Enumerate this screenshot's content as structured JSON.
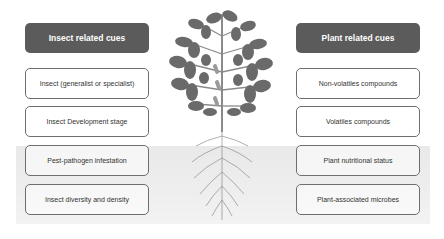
{
  "left_panel": {
    "header": "Insect related cues",
    "items": [
      "Insect (generalist or specialist)",
      "Insect Development stage",
      "Pest-pathogen infestation",
      "Insect diversity and density"
    ]
  },
  "right_panel": {
    "header": "Plant related cues",
    "items": [
      "Non-volatiles compounds",
      "Volatiles compounds",
      "Plant nutritional status",
      "Plant-associated microbes"
    ]
  },
  "illustration": {
    "icon": "plant-with-roots-icon",
    "colors": {
      "header_bg": "#5b5b5b",
      "leaf": "#6a6a6a",
      "soil": "#ececec",
      "border": "#6e6e6e"
    }
  }
}
